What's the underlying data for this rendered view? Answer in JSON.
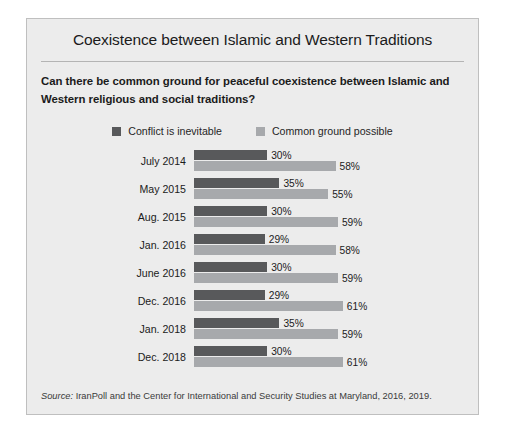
{
  "panel": {
    "title": "Coexistence between Islamic and Western Traditions",
    "question": "Can there be common ground for peaceful coexistence between Islamic and Western religious and social traditions?",
    "source_prefix": "Source:",
    "source_text": " IranPoll and the Center for International and Security Studies at Maryland, 2016, 2019."
  },
  "colors": {
    "panel_background": "#ececec",
    "panel_border": "#bfbfbf",
    "page_background": "#ffffff",
    "series_conflict": "#58595b",
    "series_common": "#a7a9ac",
    "text": "#1b1b1b",
    "rule": "#b4b4b4"
  },
  "legend": {
    "items": [
      {
        "label": "Conflict is inevitable",
        "color": "#58595b"
      },
      {
        "label": "Common ground possible",
        "color": "#a7a9ac"
      }
    ]
  },
  "chart_data": {
    "type": "bar",
    "orientation": "horizontal",
    "title": "Coexistence between Islamic and Western Traditions",
    "subtitle": "Can there be common ground for peaceful coexistence between Islamic and Western religious and social traditions?",
    "xlabel": "",
    "ylabel": "",
    "xlim": [
      0,
      100
    ],
    "grid": false,
    "legend_position": "top-center",
    "value_suffix": "%",
    "categories": [
      "July 2014",
      "May 2015",
      "Aug. 2015",
      "Jan. 2016",
      "June 2016",
      "Dec. 2016",
      "Jan. 2018",
      "Dec. 2018"
    ],
    "series": [
      {
        "name": "Conflict is inevitable",
        "color": "#58595b",
        "values": [
          30,
          35,
          30,
          29,
          30,
          29,
          35,
          30
        ],
        "labels": [
          "30%",
          "35%",
          "30%",
          "29%",
          "30%",
          "29%",
          "35%",
          "30%"
        ]
      },
      {
        "name": "Common ground possible",
        "color": "#a7a9ac",
        "values": [
          58,
          55,
          59,
          58,
          59,
          61,
          59,
          61
        ],
        "labels": [
          "58%",
          "55%",
          "59%",
          "58%",
          "59%",
          "61%",
          "59%",
          "61%"
        ]
      }
    ],
    "source": "Source: IranPoll and the Center for International and Security Studies at Maryland, 2016, 2019."
  }
}
